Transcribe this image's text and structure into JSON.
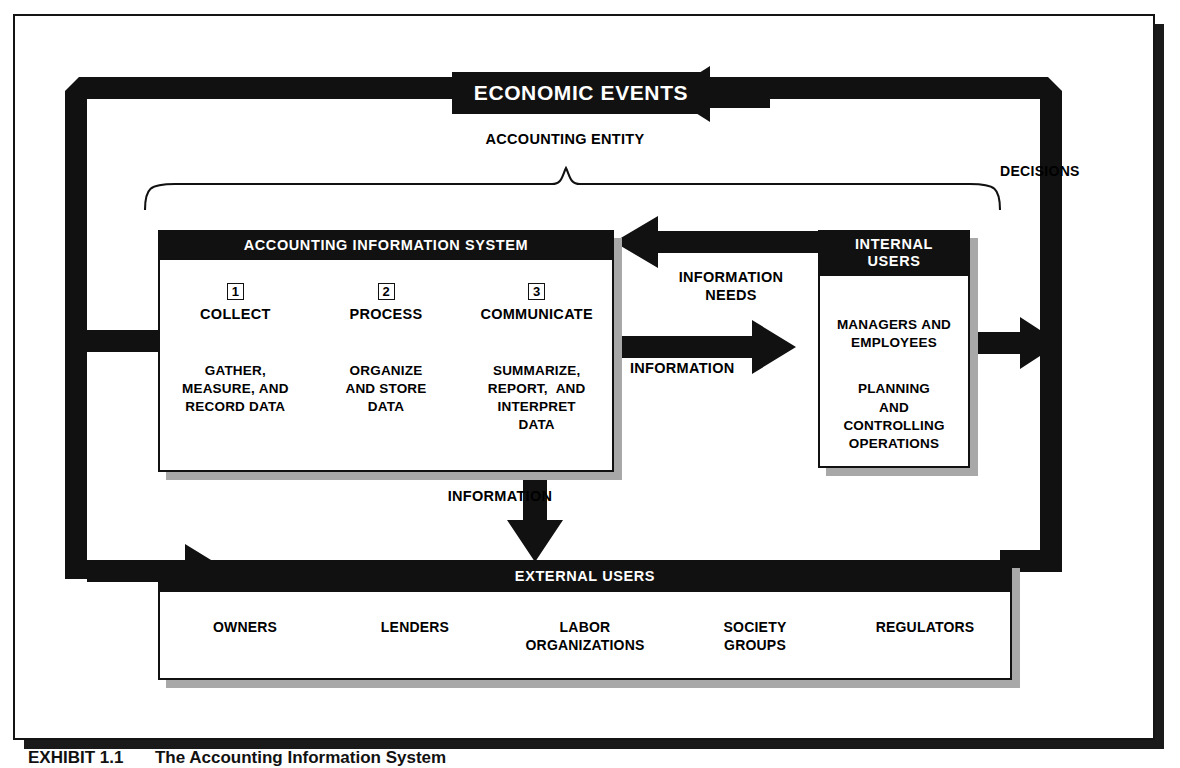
{
  "figure": {
    "caption_label": "EXHIBIT 1.1",
    "caption_title": "The Accounting Information System"
  },
  "colors": {
    "ink": "#111111",
    "paper": "#ffffff",
    "shadow": "#a8a8a8"
  },
  "nodes": {
    "economic_events": {
      "title": "ECONOMIC EVENTS"
    },
    "accounting_information_system": {
      "title": "ACCOUNTING INFORMATION SYSTEM",
      "steps": [
        {
          "number": "1",
          "verb": "COLLECT",
          "description": "GATHER,\nMEASURE, AND\nRECORD DATA"
        },
        {
          "number": "2",
          "verb": "PROCESS",
          "description": "ORGANIZE\nAND STORE\nDATA"
        },
        {
          "number": "3",
          "verb": "COMMUNICATE",
          "description": "SUMMARIZE,\nREPORT,  AND\nINTERPRET\nDATA"
        }
      ]
    },
    "internal_users": {
      "title_line1": "INTERNAL",
      "title_line2": "USERS",
      "body_line1": "MANAGERS AND\nEMPLOYEES",
      "body_line2": "PLANNING\nAND\nCONTROLLING\nOPERATIONS"
    },
    "external_users": {
      "title": "EXTERNAL USERS",
      "groups": [
        "OWNERS",
        "LENDERS",
        "LABOR\nORGANIZATIONS",
        "SOCIETY\nGROUPS",
        "REGULATORS"
      ]
    }
  },
  "labels": {
    "accounting_entity": "ACCOUNTING ENTITY",
    "decisions": "DECISIONS",
    "information_needs": "INFORMATION\nNEEDS",
    "information_to_internal": "INFORMATION",
    "information_to_external": "INFORMATION"
  },
  "flow": {
    "edges": [
      {
        "from": "internal_users",
        "to": "accounting_information_system",
        "label": "INFORMATION NEEDS"
      },
      {
        "from": "accounting_information_system",
        "to": "internal_users",
        "label": "INFORMATION"
      },
      {
        "from": "accounting_information_system",
        "to": "external_users",
        "label": "INFORMATION"
      },
      {
        "from": "internal_users",
        "to": "economic_events",
        "label": "DECISIONS"
      },
      {
        "from": "external_users",
        "to": "economic_events",
        "label": "DECISIONS"
      },
      {
        "from": "economic_events",
        "to": "accounting_information_system",
        "label": ""
      },
      {
        "from": "economic_events",
        "to": "external_users",
        "label": ""
      }
    ]
  }
}
